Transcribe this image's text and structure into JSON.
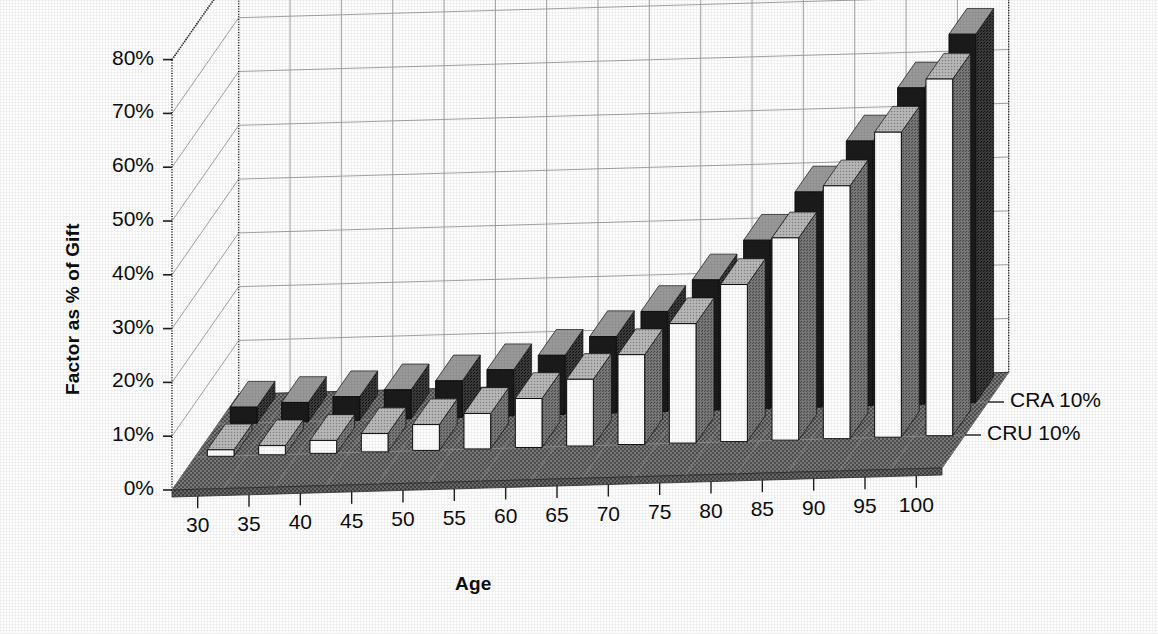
{
  "chart_data": {
    "type": "bar",
    "title": "",
    "subtitle": "",
    "xlabel": "Age",
    "ylabel": "Factor as % of Gift",
    "zlabel": "",
    "categories": [
      "30",
      "35",
      "40",
      "45",
      "50",
      "55",
      "60",
      "65",
      "70",
      "75",
      "80",
      "85",
      "90",
      "95",
      "100"
    ],
    "ylim": [
      0,
      80
    ],
    "ytick_labels": [
      "0%",
      "10%",
      "20%",
      "30%",
      "40%",
      "50%",
      "60%",
      "70%",
      "80%"
    ],
    "ytick_values": [
      0,
      10,
      20,
      30,
      40,
      50,
      60,
      70,
      80
    ],
    "grid": true,
    "legend_position": "right-depth-axis",
    "projection": "3d",
    "series": [
      {
        "name": "CRA 10%",
        "depth_label": "CRA 10%",
        "color": "#1b1b1b",
        "top_color": "#8f8f8f",
        "side_color": "#4a4a4a",
        "values": [
          3.0,
          3.6,
          4.4,
          5.4,
          6.8,
          8.6,
          11.0,
          14.2,
          18.6,
          24.2,
          31.3,
          40.0,
          49.2,
          58.8,
          68.5
        ]
      },
      {
        "name": "CRU 10%",
        "depth_label": "CRU 10%",
        "color": "#ffffff",
        "top_color": "#d8d8d8",
        "side_color": "#6e6e6e",
        "values": [
          1.2,
          1.7,
          2.4,
          3.4,
          4.8,
          6.6,
          9.1,
          12.4,
          16.7,
          22.2,
          29.2,
          37.6,
          47.0,
          56.7,
          66.3
        ]
      }
    ],
    "depth_tick_labels": [
      "CRA 10%",
      "CRU 10%"
    ]
  },
  "axes": {
    "y_title": "Factor as % of Gift",
    "x_title": "Age"
  },
  "colors": {
    "floor": "#6f6f6f",
    "floor_dark": "#5a5a5a",
    "wall": "#ffffff",
    "grid": "#9a9a9a",
    "axis": "#2a2a2a",
    "text": "#0d0d0d"
  }
}
